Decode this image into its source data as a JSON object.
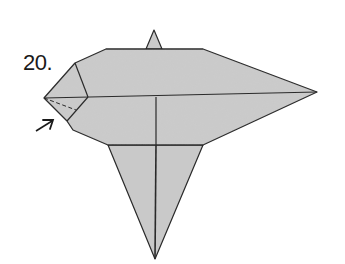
{
  "diagram": {
    "step_label": "20.",
    "paper_color": "#c8c8c8",
    "line_color": "#2a2a2a",
    "parts": [
      {
        "name": "top-spike",
        "description": "small pointed tip above body"
      },
      {
        "name": "main-body",
        "description": "wide pointed body, point to the right"
      },
      {
        "name": "bottom-tail",
        "description": "long triangular point downward"
      },
      {
        "name": "left-flap",
        "description": "small flap at left point with dashed fold line"
      }
    ],
    "annotations": [
      {
        "type": "arrow",
        "meaning": "push / fold in direction",
        "icon": "arrow-up-right-icon"
      },
      {
        "type": "dashed-line",
        "meaning": "valley fold line"
      }
    ]
  }
}
